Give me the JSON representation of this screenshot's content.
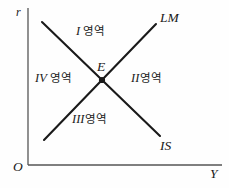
{
  "figure": {
    "type": "is-lm-diagram",
    "background_color": "#fefefe",
    "line_color": "#1a1a1a",
    "axis_color": "#555555"
  },
  "axes": {
    "y_axis_label": "r",
    "x_axis_label": "Y",
    "origin_label": "O"
  },
  "curves": {
    "lm_label": "LM",
    "is_label": "IS"
  },
  "equilibrium": {
    "point_label": "E"
  },
  "regions": [
    {
      "numeral": "I",
      "name": "영역"
    },
    {
      "numeral": "II",
      "name": "영역"
    },
    {
      "numeral": "III",
      "name": "영역"
    },
    {
      "numeral": "IV",
      "name": "영역"
    }
  ]
}
